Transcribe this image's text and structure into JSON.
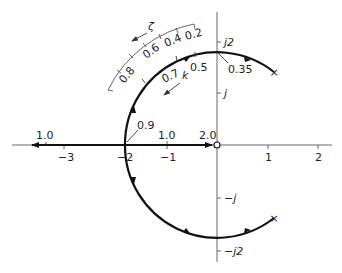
{
  "figure": {
    "type": "root-locus",
    "axes": {
      "real_ticks": [
        "−3",
        "−2",
        "−1",
        "1",
        "2"
      ],
      "imag_ticks": [
        "j2",
        "j",
        "−j",
        "−j2"
      ]
    },
    "zeta_scale": {
      "symbol": "ζ",
      "labels": [
        "0.2",
        "0.4",
        "0.6",
        "0.8"
      ]
    },
    "k_labels": {
      "symbol": "k",
      "on_locus": [
        "0.5",
        "0.7"
      ],
      "top_crossing": "0.35",
      "breakin": "0.9",
      "real_axis": [
        "1.0",
        "1.0",
        "2.0"
      ]
    },
    "markers": {
      "pole_symbol": "×",
      "zero_symbol": "○"
    },
    "colors": {
      "locus": "#111111",
      "axis": "#555555",
      "background": "#ffffff"
    }
  }
}
